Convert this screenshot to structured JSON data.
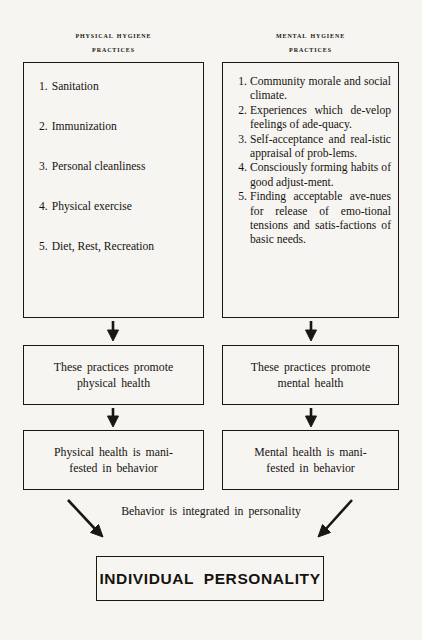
{
  "diagram": {
    "title_final": "INDIVIDUAL PERSONALITY",
    "caption_middle": "Behavior is integrated in personality",
    "ink_color": "#1a1713",
    "paper_color": "#f6f5f2"
  },
  "columns": {
    "physical": {
      "heading_line1": "PHYSICAL HYGIENE",
      "heading_line2": "PRACTICES",
      "practices": [
        {
          "num": "1.",
          "text": "Sanitation"
        },
        {
          "num": "2.",
          "text": "Immunization"
        },
        {
          "num": "3.",
          "text": "Personal cleanliness"
        },
        {
          "num": "4.",
          "text": "Physical exercise"
        },
        {
          "num": "5.",
          "text": "Diet, Rest, Recreation"
        }
      ],
      "promote_line1": "These practices promote",
      "promote_line2": "physical health",
      "manifest_line1": "Physical health is mani-",
      "manifest_line2": "fested in behavior"
    },
    "mental": {
      "heading_line1": "MENTAL HYGIENE",
      "heading_line2": "PRACTICES",
      "practices": [
        {
          "num": "1.",
          "text": "Community morale and social climate."
        },
        {
          "num": "2.",
          "text": "Experiences which de-velop feelings of ade-quacy."
        },
        {
          "num": "3.",
          "text": "Self-acceptance and real-istic appraisal of prob-lems."
        },
        {
          "num": "4.",
          "text": "Consciously forming habits of good adjust-ment."
        },
        {
          "num": "5.",
          "text": "Finding acceptable ave-nues for release of emo-tional tensions and satis-factions of basic needs."
        }
      ],
      "promote_line1": "These practices promote",
      "promote_line2": "mental health",
      "manifest_line1": "Mental health is mani-",
      "manifest_line2": "fested in behavior"
    }
  },
  "arrows": {
    "down_icon": "arrow-down",
    "diagonal_icon": "arrow-diagonal"
  }
}
